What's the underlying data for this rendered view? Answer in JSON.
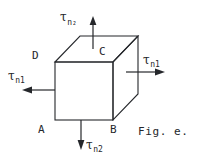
{
  "figure": {
    "caption": "Fig. e.",
    "vertices": [
      {
        "id": "A",
        "label": "A"
      },
      {
        "id": "B",
        "label": "B"
      },
      {
        "id": "C",
        "label": "C"
      },
      {
        "id": "D",
        "label": "D"
      }
    ],
    "stress_labels": {
      "top": {
        "symbol": "τ",
        "subscript": "n₂",
        "direction": "up"
      },
      "bottom": {
        "symbol": "τ",
        "subscript": "n2",
        "direction": "down"
      },
      "left": {
        "symbol": "τ",
        "subscript": "n1",
        "direction": "left"
      },
      "right": {
        "symbol": "τ",
        "subscript": "n1",
        "direction": "right"
      }
    },
    "colors": {
      "ink": "#25272b",
      "background": "#ffffff"
    }
  }
}
